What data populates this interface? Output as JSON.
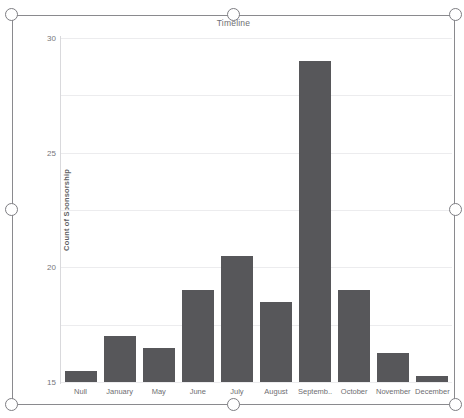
{
  "chart_data": {
    "type": "bar",
    "title": "Timeline",
    "xlabel": "",
    "ylabel": "Count of Sponsorship",
    "categories": [
      "Null",
      "January",
      "May",
      "June",
      "July",
      "August",
      "Septemb..",
      "October",
      "November",
      "December"
    ],
    "values": [
      1,
      4,
      3,
      8,
      11,
      7,
      28,
      8,
      2.5,
      0.5
    ],
    "ylim": [
      0,
      30
    ],
    "yticks": [
      0,
      5,
      10,
      15,
      20,
      25,
      30
    ],
    "grid": true,
    "legend": false,
    "bar_color": "#57575a"
  },
  "selection": {
    "handles": [
      {
        "name": "handle-top-left",
        "x": 5,
        "y": 8
      },
      {
        "name": "handle-top-center",
        "x": 227,
        "y": 8
      },
      {
        "name": "handle-top-right",
        "x": 449,
        "y": 8
      },
      {
        "name": "handle-middle-left",
        "x": 5,
        "y": 203
      },
      {
        "name": "handle-middle-right",
        "x": 449,
        "y": 203
      },
      {
        "name": "handle-bottom-left",
        "x": 5,
        "y": 398
      },
      {
        "name": "handle-bottom-center",
        "x": 227,
        "y": 398
      },
      {
        "name": "handle-bottom-right",
        "x": 449,
        "y": 398
      }
    ]
  }
}
